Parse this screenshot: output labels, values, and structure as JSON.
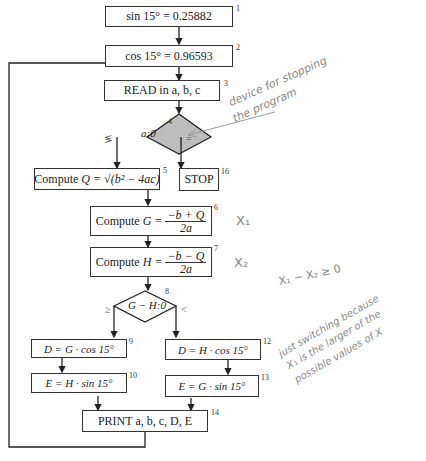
{
  "nodes": {
    "n1": {
      "text": "sin 15° = 0.25882",
      "num": "1"
    },
    "n2": {
      "text": "cos 15° = 0.96593",
      "num": "2"
    },
    "n3": {
      "text": "READ in a, b, c",
      "num": "3"
    },
    "n4": {
      "text": "a:0",
      "num": "4",
      "left_label": "≶",
      "right_label": "="
    },
    "n5": {
      "prefix": "Compute",
      "text": "Q = √(b² − 4ac)",
      "num": "5"
    },
    "n16": {
      "text": "STOP",
      "num": "16"
    },
    "n6": {
      "prefix": "Compute",
      "lhs": "G =",
      "numer": "−b + Q",
      "denom": "2a",
      "num": "6"
    },
    "n7": {
      "prefix": "Compute",
      "lhs": "H =",
      "numer": "−b − Q",
      "denom": "2a",
      "num": "7"
    },
    "n8": {
      "text": "G − H:0",
      "num": "8",
      "left_label": "≥",
      "right_label": "<"
    },
    "n9": {
      "text": "D = G · cos 15°",
      "num": "9"
    },
    "n10": {
      "text": "E = H · sin 15°",
      "num": "10"
    },
    "n12": {
      "text": "D = H · cos 15°",
      "num": "12"
    },
    "n13": {
      "text": "E = G · sin 15°",
      "num": "13"
    },
    "n14": {
      "text": "PRINT a, b, c, D, E",
      "num": "14"
    }
  },
  "annotations": {
    "stop_note_1": "device for stopping",
    "stop_note_2": "the program",
    "x1_note": "X₁",
    "x2_note": "X₂",
    "ineq_note": "X₁ − X₂ ≥ 0",
    "switch_1": "just switching because",
    "switch_2": "X₁ is the larger of the",
    "switch_3": "possible values of X"
  }
}
